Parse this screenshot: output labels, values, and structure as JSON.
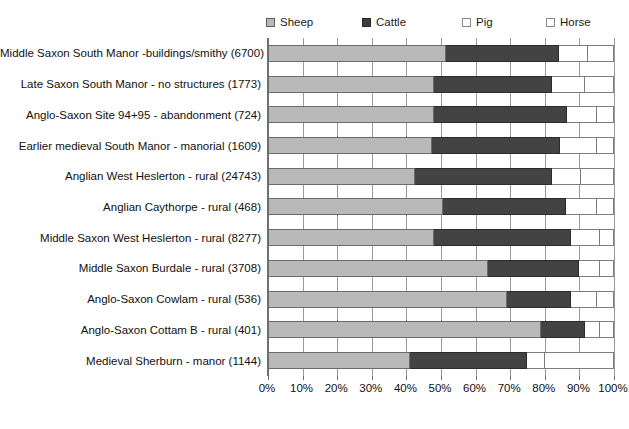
{
  "legend": {
    "items": [
      {
        "label": "Sheep",
        "key": "sheep",
        "color": "#b9b9b9",
        "icon": "sheep-swatch-icon"
      },
      {
        "label": "Cattle",
        "key": "cattle",
        "color": "#434343",
        "icon": "cattle-swatch-icon"
      },
      {
        "label": "Pig",
        "key": "pig",
        "color": "#ffffff",
        "icon": "pig-swatch-icon"
      },
      {
        "label": "Horse",
        "key": "horse",
        "color": "#ffffff",
        "icon": "horse-swatch-icon"
      }
    ]
  },
  "axis": {
    "ticks": [
      "0%",
      "10%",
      "20%",
      "30%",
      "40%",
      "50%",
      "60%",
      "70%",
      "80%",
      "90%",
      "100%"
    ],
    "min": 0,
    "max": 100
  },
  "chart_data": {
    "type": "bar",
    "orientation": "horizontal",
    "stacked": true,
    "normalized": true,
    "title": "",
    "xlabel": "",
    "ylabel": "",
    "xlim": [
      0,
      100
    ],
    "grid": true,
    "legend_position": "top",
    "categories": [
      "Middle Saxon South Manor -buildings/smithy  (6700)",
      "Late Saxon South Manor - no structures  (1773)",
      "Anglo-Saxon Site 94+95 - abandonment  (724)",
      "Earlier medieval South Manor - manorial  (1609)",
      "Anglian West Heslerton - rural  (24743)",
      "Anglian Caythorpe - rural  (468)",
      "Middle Saxon West Heslerton - rural  (8277)",
      "Middle Saxon Burdale - rural  (3708)",
      "Anglo-Saxon Cowlam - rural  (536)",
      "Anglo-Saxon Cottam B - rural  (401)",
      "Medieval Sherburn - manor  (1144)"
    ],
    "series": [
      {
        "name": "Sheep",
        "values": [
          51.5,
          48.0,
          48.0,
          47.5,
          42.5,
          50.5,
          48.0,
          63.5,
          69.0,
          79.0,
          41.0
        ]
      },
      {
        "name": "Cattle",
        "values": [
          32.5,
          34.0,
          38.5,
          37.0,
          39.5,
          35.5,
          39.5,
          26.5,
          18.5,
          12.5,
          34.0
        ]
      },
      {
        "name": "Pig",
        "values": [
          8.5,
          9.5,
          8.5,
          10.5,
          8.5,
          9.0,
          8.5,
          6.0,
          7.5,
          4.5,
          5.0
        ]
      },
      {
        "name": "Horse",
        "values": [
          7.5,
          8.5,
          5.0,
          5.0,
          9.5,
          5.0,
          4.0,
          4.0,
          5.0,
          4.0,
          20.0
        ]
      }
    ]
  }
}
